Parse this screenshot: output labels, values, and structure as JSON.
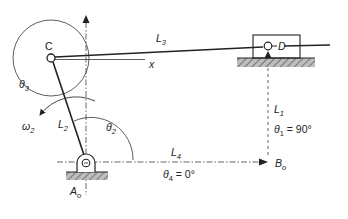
{
  "diagram": {
    "type": "slider-crank mechanism (vector loop diagram)",
    "labels": {
      "C": "C",
      "D": "D",
      "L3_main": "L",
      "L3_sub": "3",
      "x": "x",
      "theta3_main": "θ",
      "theta3_sub": "3",
      "omega2_main": "ω",
      "omega2_sub": "2",
      "L2_main": "L",
      "L2_sub": "2",
      "theta2_main": "θ",
      "theta2_sub": "2",
      "L1_main": "L",
      "L1_sub": "1",
      "theta1_main": "θ",
      "theta1_sub": "1",
      "theta1_value": " = 90°",
      "L4_main": "L",
      "L4_sub": "4",
      "theta4_main": "θ",
      "theta4_sub": "4",
      "theta4_value": " = 0°",
      "Ao_main": "A",
      "Ao_sub": "o",
      "Bo_main": "B",
      "Bo_sub": "o"
    },
    "colors": {
      "line": "#222222",
      "hatch_fill": "#9a9a9a",
      "axis": "#555555"
    }
  }
}
